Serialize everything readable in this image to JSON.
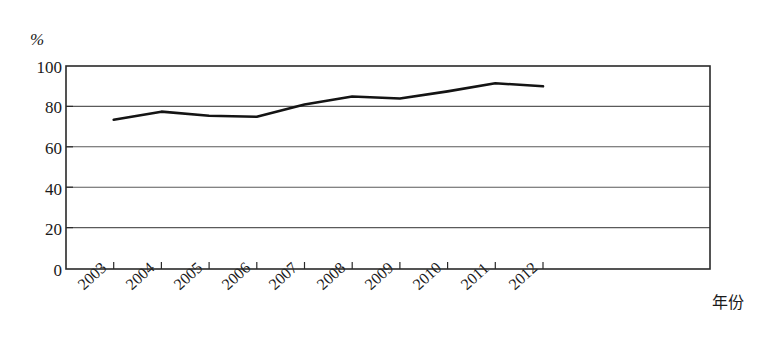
{
  "chart_data": {
    "type": "line",
    "title": "",
    "subtitle": "",
    "xlabel": "年份",
    "ylabel": "%",
    "unit_label": "%",
    "categories": [
      "2003",
      "2004",
      "2005",
      "2006",
      "2007",
      "2008",
      "2009",
      "2010",
      "2011",
      "2012"
    ],
    "values": [
      73.5,
      77.5,
      75.5,
      75,
      81,
      85,
      84,
      87.5,
      91.5,
      90
    ],
    "series": [
      {
        "name": "",
        "values": [
          73.5,
          77.5,
          75.5,
          75,
          81,
          85,
          84,
          87.5,
          91.5,
          90
        ]
      }
    ],
    "y_ticks": [
      0,
      20,
      40,
      60,
      80,
      100
    ],
    "y_tick_labels": [
      "0",
      "20",
      "40",
      "60",
      "80",
      "100"
    ],
    "x_tick_labels": [
      "2003",
      "2004",
      "2005",
      "2006",
      "2007",
      "2008",
      "2009",
      "2010",
      "2011",
      "2012"
    ],
    "ylim": [
      0,
      100
    ],
    "grid": true,
    "grid_axis": "y",
    "legend": false,
    "legend_position": "none",
    "line_color": "#141414",
    "grid_color": "#5a5a5a",
    "axis_color": "#2a2a2a",
    "background_color": "#ffffff",
    "line_width": 2.6,
    "markers": false,
    "annotations": []
  },
  "layout": {
    "plot_left": 66,
    "plot_right": 710,
    "plot_top": 66,
    "plot_bottom": 269,
    "tick_step": 47.7
  }
}
